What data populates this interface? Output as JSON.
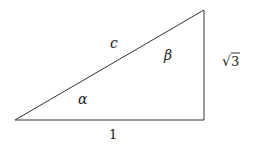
{
  "diagram": {
    "type": "right-triangle",
    "vertices": {
      "left": [
        15,
        120
      ],
      "bottom_right": [
        204,
        120
      ],
      "top_right": [
        204,
        10
      ]
    },
    "sides": {
      "base": {
        "label": "1"
      },
      "height": {
        "label_radical": "√",
        "label_value": "3"
      },
      "hypotenuse": {
        "label": "c"
      }
    },
    "angles": {
      "alpha": {
        "label": "α"
      },
      "beta": {
        "label": "β"
      }
    },
    "colors": {
      "stroke": "#333333",
      "text": "#1a1a1a",
      "background": "#ffffff"
    }
  }
}
